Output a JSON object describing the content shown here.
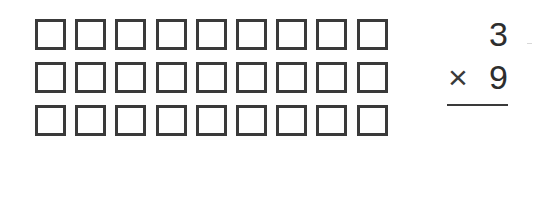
{
  "worksheet": {
    "array": {
      "rows": 3,
      "columns": 9,
      "box_count": 27,
      "box_style": "empty-square"
    },
    "problem": {
      "multiplicand": "3",
      "operator": "×",
      "multiplier": "9",
      "answer": ""
    },
    "colors": {
      "ink": "#3a3a3a",
      "background": "#ffffff"
    }
  }
}
